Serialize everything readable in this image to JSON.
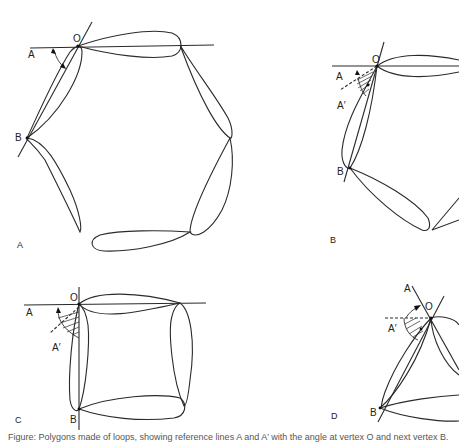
{
  "figure": {
    "panels": [
      {
        "id": "A",
        "panel_label": "A",
        "shape": "hexagon of six petal-shaped loops",
        "point_labels": {
          "origin": "O",
          "ref_line": "A",
          "vertex": "B"
        }
      },
      {
        "id": "B",
        "panel_label": "B",
        "shape": "pentagon-like arrangement of petal loops",
        "point_labels": {
          "origin": "O",
          "ref_line": "A",
          "ref_line_prime": "A′",
          "vertex": "B"
        }
      },
      {
        "id": "C",
        "panel_label": "C",
        "shape": "square of four petal loops",
        "point_labels": {
          "origin": "O",
          "ref_line": "A",
          "ref_line_prime": "A′",
          "vertex": "B"
        }
      },
      {
        "id": "D",
        "panel_label": "D",
        "shape": "triangle of three petal loops",
        "point_labels": {
          "origin": "O",
          "ref_line": "A",
          "ref_line_prime": "A′",
          "vertex": "B"
        }
      }
    ],
    "caption": "Figure: Polygons made of loops, showing reference lines A and A′ with the angle at vertex O and next vertex B."
  }
}
